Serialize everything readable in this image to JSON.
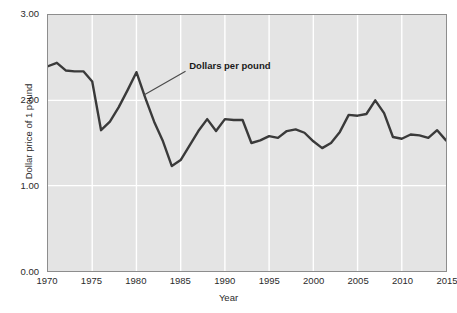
{
  "chart_data": {
    "type": "line",
    "title": "",
    "xlabel": "Year",
    "ylabel": "Dollar price of 1 pound",
    "xlim": [
      1970,
      2015
    ],
    "ylim": [
      0.0,
      3.0
    ],
    "grid": true,
    "legend_position": "none",
    "y_ticks": [
      "3.00",
      "2.00",
      "1.00",
      "0.00"
    ],
    "y_tick_values": [
      3.0,
      2.0,
      1.0,
      0.0
    ],
    "x_ticks": [
      "1970",
      "1975",
      "1980",
      "1985",
      "1990",
      "1995",
      "2000",
      "2005",
      "2010",
      "2015"
    ],
    "x_tick_values": [
      1970,
      1975,
      1980,
      1985,
      1990,
      1995,
      2000,
      2005,
      2010,
      2015
    ],
    "annotations": [
      {
        "text": "Dollars per pound",
        "x": 1986.0,
        "y": 2.4,
        "leader_to_x": 1980.8,
        "leader_to_y": 2.06
      }
    ],
    "series": [
      {
        "name": "Dollars per pound",
        "color": "#3a3a3a",
        "x": [
          1970,
          1971,
          1972,
          1973,
          1974,
          1975,
          1976,
          1977,
          1978,
          1979,
          1980,
          1981,
          1982,
          1983,
          1984,
          1985,
          1986,
          1987,
          1988,
          1989,
          1990,
          1991,
          1992,
          1993,
          1994,
          1995,
          1996,
          1997,
          1998,
          1999,
          2000,
          2001,
          2002,
          2003,
          2004,
          2005,
          2006,
          2007,
          2008,
          2009,
          2010,
          2011,
          2012,
          2013,
          2014,
          2015
        ],
        "values": [
          2.4,
          2.44,
          2.35,
          2.34,
          2.34,
          2.22,
          1.65,
          1.75,
          1.92,
          2.12,
          2.33,
          2.03,
          1.75,
          1.52,
          1.23,
          1.3,
          1.47,
          1.64,
          1.78,
          1.64,
          1.78,
          1.77,
          1.77,
          1.5,
          1.53,
          1.58,
          1.56,
          1.64,
          1.66,
          1.62,
          1.52,
          1.44,
          1.5,
          1.63,
          1.83,
          1.82,
          1.84,
          2.0,
          1.85,
          1.57,
          1.55,
          1.6,
          1.59,
          1.56,
          1.65,
          1.53
        ]
      }
    ]
  }
}
